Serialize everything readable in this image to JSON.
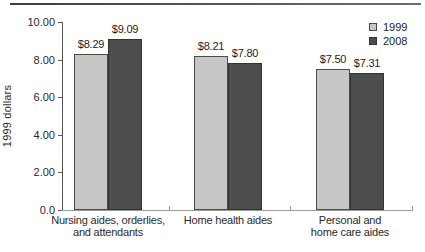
{
  "chart_data": {
    "type": "bar",
    "ylabel": "1999 dollars",
    "ylim": [
      0,
      10
    ],
    "ytick_values": [
      0,
      2,
      4,
      6,
      8,
      10
    ],
    "ytick_labels": [
      "0.0",
      "2.00",
      "4.00",
      "6.00",
      "8.00",
      "10.00"
    ],
    "grid": false,
    "legend_position": "top-right",
    "categories": [
      [
        "Nursing aides, orderlies,",
        "and attendants"
      ],
      [
        "Home health aides"
      ],
      [
        "Personal and",
        "home care aides"
      ]
    ],
    "series": [
      {
        "name": "1999",
        "values": [
          8.29,
          8.21,
          7.5
        ],
        "data_labels": [
          "$8.29",
          "$8.21",
          "$7.50"
        ],
        "color": "#c7c7c5",
        "border_color": "#4a4a48"
      },
      {
        "name": "2008",
        "values": [
          9.09,
          7.8,
          7.31
        ],
        "data_labels": [
          "$9.09",
          "$7.80",
          "$7.31"
        ],
        "color": "#4d4d4b",
        "border_color": "#333331"
      }
    ]
  }
}
